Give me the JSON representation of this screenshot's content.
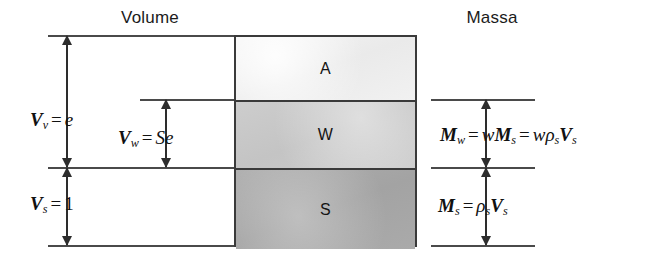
{
  "diagram": {
    "headers": {
      "volume": "Volume",
      "mass": "Massa"
    },
    "phases": [
      {
        "key": "air",
        "label": "A",
        "name": "air-phase",
        "color": "#eaeaea"
      },
      {
        "key": "water",
        "label": "W",
        "name": "water-phase",
        "color": "#c4c4c4"
      },
      {
        "key": "solid",
        "label": "S",
        "name": "solid-phase",
        "color": "#a3a3a3"
      }
    ],
    "volume_labels": {
      "voids": {
        "symbol": "V",
        "subscript": "v",
        "equals": "=",
        "value": "e"
      },
      "water": {
        "symbol": "V",
        "subscript": "w",
        "equals": "=",
        "value": "Se"
      },
      "solids": {
        "symbol": "V",
        "subscript": "s",
        "equals": "=",
        "value": "1"
      }
    },
    "mass_labels": {
      "water": {
        "symbol": "M",
        "subscript": "w",
        "equals": "=",
        "expr1_symbol": "M",
        "expr1_sub": "s",
        "expr1_coef": "w",
        "equals2": "=",
        "expr2_coef": "w",
        "expr2_rho": "ρ",
        "expr2_rho_sub": "s",
        "expr2_v": "V",
        "expr2_v_sub": "s"
      },
      "solids": {
        "symbol": "M",
        "subscript": "s",
        "equals": "=",
        "rho": "ρ",
        "rho_sub": "s",
        "v": "V",
        "v_sub": "s"
      }
    },
    "colors": {
      "line": "#4a4a4a",
      "arrow": "#2d2d2d",
      "border": "#3a3a3a",
      "text": "#111111",
      "background": "#ffffff"
    }
  }
}
